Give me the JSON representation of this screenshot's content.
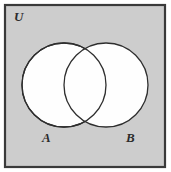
{
  "figure": {
    "kind": "venn-diagram",
    "width": 171,
    "height": 172
  },
  "colors": {
    "page_background": "#ffffff",
    "universe_fill": "#cdcdcd",
    "universe_border": "#3a3a3a",
    "set_fill": "#fefefe",
    "set_border": "#2e2e2e",
    "label_color": "#2b2b2b"
  },
  "universe": {
    "label": "U",
    "label_x": 14,
    "label_y": 21,
    "box": {
      "x": 5,
      "y": 5,
      "width": 160,
      "height": 162,
      "stroke_width": 2.2
    }
  },
  "sets": [
    {
      "name": "set-a",
      "label": "A",
      "cx": 64,
      "cy": 85,
      "r": 42,
      "label_x": 42,
      "label_y": 142
    },
    {
      "name": "set-b",
      "label": "B",
      "cx": 106,
      "cy": 85,
      "r": 42,
      "label_x": 126,
      "label_y": 142
    }
  ],
  "geometry": {
    "circle_stroke_width": 1.3,
    "label_font_size": 13
  }
}
